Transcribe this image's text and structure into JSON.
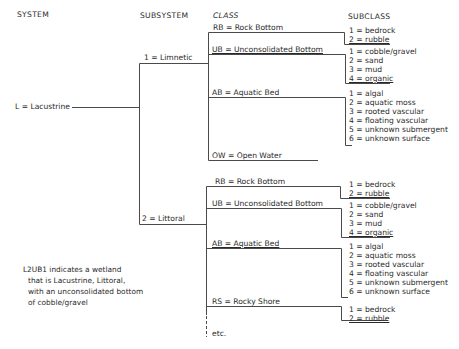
{
  "headers": {
    "system": "SYSTEM",
    "subsystem": "SUBSYSTEM",
    "class": "CLASS",
    "subclass": "SUBCLASS"
  },
  "system": {
    "label": "L = Lacustrine"
  },
  "subsystems": [
    {
      "label": "1 = Limnetic",
      "classes": [
        {
          "label": "RB = Rock Bottom",
          "subclasses": [
            "1 = bedrock",
            "2 = rubble"
          ]
        },
        {
          "label": "UB = Unconsolidated Bottom",
          "subclasses": [
            "1 = cobble/gravel",
            "2 = sand",
            "3 = mud",
            "4 = organic"
          ]
        },
        {
          "label": "AB = Aquatic Bed",
          "subclasses": [
            "1 = algal",
            "2 = aquatic moss",
            "3 = rooted vascular",
            "4 = floating vascular",
            "5 = unknown submergent",
            "6 = unknown surface"
          ]
        },
        {
          "label": "OW = Open Water",
          "subclasses": []
        }
      ]
    },
    {
      "label": "2 = Littoral",
      "classes": [
        {
          "label": "RB = Rock Bottom",
          "subclasses": [
            "1 = bedrock",
            "2 = rubble"
          ]
        },
        {
          "label": "UB = Unconsolidated Bottom",
          "subclasses": [
            "1 = cobble/gravel",
            "2 = sand",
            "3 = mud",
            "4 = organic"
          ]
        },
        {
          "label": "AB = Aquatic Bed",
          "subclasses": [
            "1 = algal",
            "2 = aquatic moss",
            "3 = rooted vascular",
            "4 = floating vascular",
            "5 = unknown submergent",
            "6 = unknown surface"
          ]
        },
        {
          "label": "RS = Rocky Shore",
          "subclasses": [
            "1 = bedrock",
            "2 = rubble"
          ]
        }
      ],
      "more": "etc."
    }
  ],
  "note": {
    "lines": [
      "L2UB1 indicates a wetland",
      "that is Lacustrine, Littoral,",
      "with an unconsolidated bottom",
      "of cobble/gravel"
    ]
  },
  "colors": {
    "line": "#4a4a4a",
    "text": "#2a2a2a"
  }
}
